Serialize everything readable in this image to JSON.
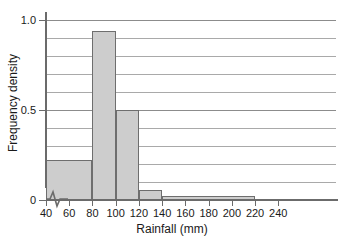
{
  "chart_data": {
    "type": "bar",
    "title": "",
    "xlabel": "Rainfall (mm)",
    "ylabel": "Frequency density",
    "xlim": [
      30,
      250
    ],
    "ylim": [
      0,
      1.05
    ],
    "grid": true,
    "legend": null,
    "axis_break_x": true,
    "x_ticks": [
      40,
      60,
      80,
      100,
      120,
      140,
      160,
      180,
      200,
      220,
      240
    ],
    "x_tick_labels": [
      "40",
      "60",
      "80",
      "100",
      "120",
      "140",
      "160",
      "180",
      "200",
      "220",
      "240"
    ],
    "y_ticks": [
      0,
      0.5,
      1.0
    ],
    "y_tick_labels": [
      "0",
      "0.5",
      "1.0"
    ],
    "y_gridlines": [
      0.1,
      0.2,
      0.3,
      0.4,
      0.5,
      0.6,
      0.7,
      0.8,
      0.9,
      1.0
    ],
    "bars": [
      {
        "label": "40-80",
        "x0": 40,
        "x1": 80,
        "value": 0.22
      },
      {
        "label": "80-100",
        "x0": 80,
        "x1": 100,
        "value": 0.94
      },
      {
        "label": "100-120",
        "x0": 100,
        "x1": 120,
        "value": 0.5
      },
      {
        "label": "120-140",
        "x0": 120,
        "x1": 140,
        "value": 0.055
      },
      {
        "label": "140-220",
        "x0": 140,
        "x1": 220,
        "value": 0.02
      }
    ],
    "bar_fill_color": "#cdcdcd",
    "bar_edge_color": "#6e6e6e",
    "grid_color": "#a9a9a9",
    "axis_color": "#6b6b6b"
  }
}
